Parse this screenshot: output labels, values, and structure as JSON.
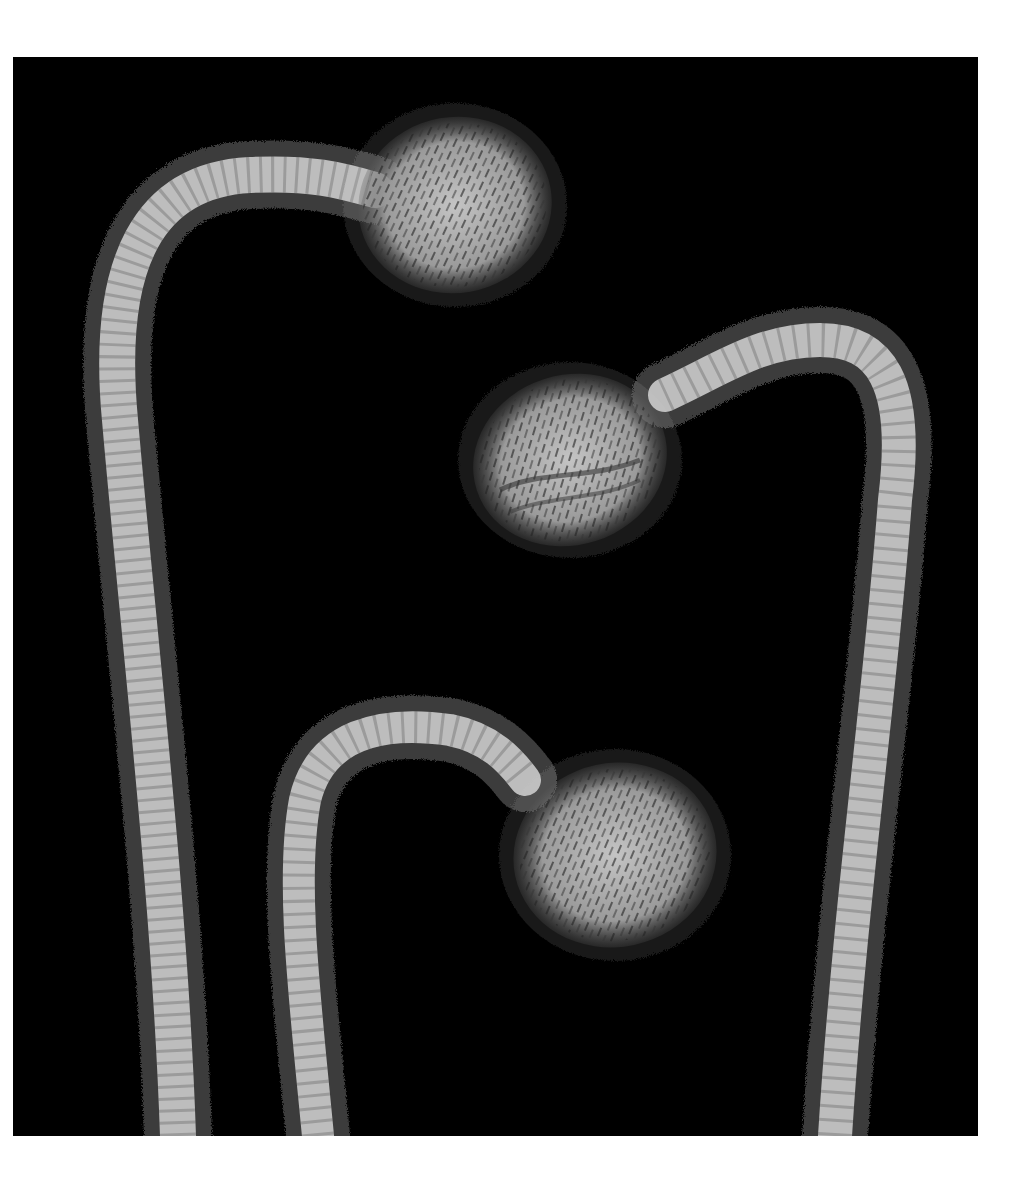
{
  "image": {
    "subject": "Three hairy stems with drooping buds",
    "background_color": "#000000",
    "border_color": "#ffffff",
    "frame": {
      "x": 13,
      "y": 57,
      "width": 965,
      "height": 1079
    },
    "stem_color": "#bdbdbd",
    "bud_color": "#a9a9a9",
    "hair_color": "#d8d8d8"
  },
  "elements": [
    {
      "name": "left-stem-with-top-bud",
      "bud_center": [
        455,
        205
      ],
      "bud_radius": [
        97,
        88
      ]
    },
    {
      "name": "right-stem-with-middle-bud",
      "bud_center": [
        570,
        460
      ],
      "bud_radius": [
        98,
        85
      ]
    },
    {
      "name": "bottom-stem-with-lower-bud",
      "bud_center": [
        615,
        855
      ],
      "bud_radius": [
        102,
        92
      ]
    }
  ]
}
